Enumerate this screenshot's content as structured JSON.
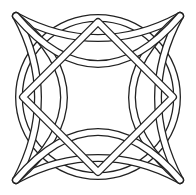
{
  "image": {
    "title": "Celtic knot line drawing",
    "width": 196,
    "height": 195,
    "background": "#ffffff",
    "stroke_color": "#222222",
    "band_fill": "#ffffff",
    "elements": [
      "outer-circle-band",
      "central-diamond-band",
      "four-interlaced-arcs",
      "four-corner-pointed-lobes"
    ]
  }
}
